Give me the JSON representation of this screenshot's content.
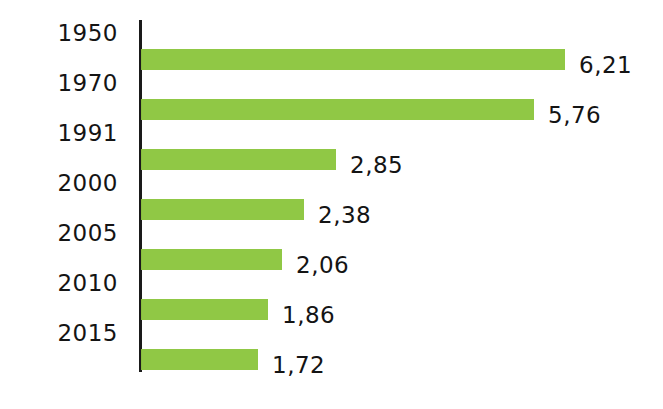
{
  "chart_data": {
    "type": "bar",
    "orientation": "horizontal",
    "title": "",
    "subtitle": "",
    "xlabel": "",
    "ylabel": "",
    "grid": false,
    "legend": null,
    "decimal_separator": ",",
    "axis_line_color": "#1a1a1a",
    "bar_color": "#8CC63F",
    "background_color": "#ffffff",
    "text_color": "#141414",
    "xlim": [
      0,
      6.21
    ],
    "categories": [
      "1950",
      "1970",
      "1991",
      "2000",
      "2005",
      "2010",
      "2015"
    ],
    "values": [
      6.21,
      5.76,
      2.85,
      2.38,
      2.06,
      1.86,
      1.72
    ],
    "value_labels": [
      "6,21",
      "5,76",
      "2,85",
      "2,38",
      "2,06",
      "1,86",
      "1,72"
    ],
    "rows": [
      {
        "category": "1950",
        "value": 6.21,
        "label": "6,21"
      },
      {
        "category": "1970",
        "value": 5.76,
        "label": "5,76"
      },
      {
        "category": "1991",
        "value": 2.85,
        "label": "2,85"
      },
      {
        "category": "2000",
        "value": 2.38,
        "label": "2,38"
      },
      {
        "category": "2005",
        "value": 2.06,
        "label": "2,06"
      },
      {
        "category": "2010",
        "value": 1.86,
        "label": "1,86"
      },
      {
        "category": "2015",
        "value": 1.72,
        "label": "1,72"
      }
    ]
  },
  "layout": {
    "axis_x": 141,
    "axis_top": 20,
    "axis_height": 352,
    "row_top_start": 21,
    "row_pitch": 50,
    "bar_height": 21,
    "px_per_unit": 68.3,
    "value_label_gap": 14
  }
}
